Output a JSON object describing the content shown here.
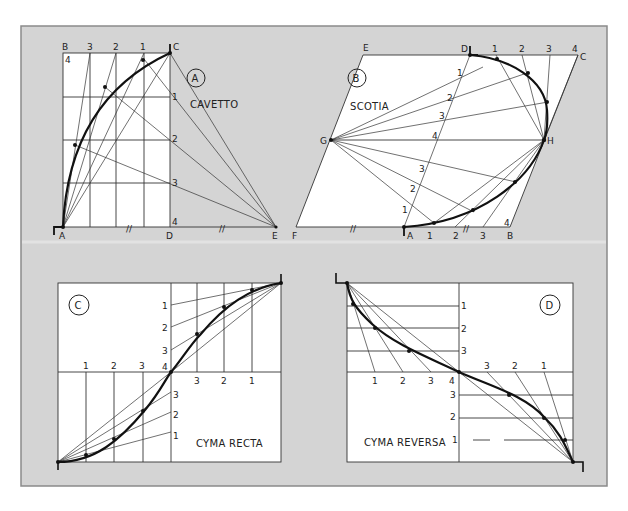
{
  "colors": {
    "background": "#ffffff",
    "panel_fill": "#d4d4d4",
    "panel_border": "#8a8a8a",
    "drawing_fill": "#ffffff",
    "ink": "#222222"
  },
  "panels": {
    "a": {
      "badge": "A",
      "title": "CAVETTO",
      "corner_labels": {
        "top_left": "B",
        "top_right": "C",
        "bottom_left": "A",
        "bottom_mid": "D",
        "bottom_right": "E"
      },
      "top_divisions": [
        "3",
        "2",
        "1"
      ],
      "right_divisions": [
        "1",
        "2",
        "3",
        "4"
      ],
      "left_top_division": "4",
      "equal_marks": [
        "//",
        "//"
      ]
    },
    "b": {
      "badge": "B",
      "title": "SCOTIA",
      "corner_labels": {
        "top_left": "E",
        "top_mid": "D",
        "top_right": "C",
        "left_mid": "G",
        "right_mid": "H",
        "bottom_left": "F",
        "bottom_mid": "A",
        "bottom_right": "B"
      },
      "top_divisions": [
        "1",
        "2",
        "3",
        "4"
      ],
      "diagonal_divisions_upper": [
        "1",
        "2",
        "3",
        "4"
      ],
      "diagonal_divisions_lower": [
        "3",
        "2",
        "1"
      ],
      "bottom_divisions": [
        "1",
        "2",
        "3",
        "4"
      ],
      "equal_marks": [
        "//",
        "//"
      ]
    },
    "c": {
      "badge": "C",
      "title": "CYMA RECTA",
      "upper_vertical_divisions": [
        "1",
        "2",
        "3"
      ],
      "center_label": "4",
      "upper_horizontal_divisions": [
        "3",
        "2",
        "1"
      ],
      "lower_horizontal_divisions": [
        "1",
        "2",
        "3"
      ],
      "lower_vertical_divisions": [
        "3",
        "2",
        "1"
      ]
    },
    "d": {
      "badge": "D",
      "title": "CYMA REVERSA",
      "upper_vertical_divisions": [
        "1",
        "2",
        "3"
      ],
      "lower_horizontal_divisions_left": [
        "1",
        "2",
        "3"
      ],
      "center_label": "4",
      "upper_horizontal_divisions_right": [
        "3",
        "2",
        "1"
      ],
      "lower_vertical_divisions": [
        "3",
        "2",
        "1"
      ]
    }
  }
}
